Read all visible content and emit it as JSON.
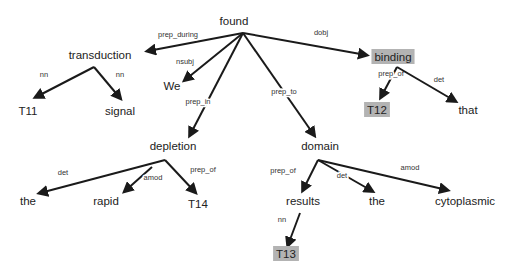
{
  "colors": {
    "background": "#ffffff",
    "edge": "#1a1a1a",
    "text": "#222222",
    "highlight": "#b3b3b3"
  },
  "nodes": [
    {
      "id": "found",
      "label": "found",
      "x": 234,
      "y": 21,
      "highlight": false
    },
    {
      "id": "transduction",
      "label": "transduction",
      "x": 100,
      "y": 55,
      "highlight": false
    },
    {
      "id": "We",
      "label": "We",
      "x": 172,
      "y": 86,
      "highlight": false
    },
    {
      "id": "binding",
      "label": "binding",
      "x": 393,
      "y": 57,
      "highlight": true
    },
    {
      "id": "T11",
      "label": "T11",
      "x": 28,
      "y": 111,
      "highlight": false
    },
    {
      "id": "signal",
      "label": "signal",
      "x": 120,
      "y": 111,
      "highlight": false
    },
    {
      "id": "T12",
      "label": "T12",
      "x": 377,
      "y": 110,
      "highlight": true
    },
    {
      "id": "that",
      "label": "that",
      "x": 468,
      "y": 110,
      "highlight": false
    },
    {
      "id": "depletion",
      "label": "depletion",
      "x": 173,
      "y": 146,
      "highlight": false
    },
    {
      "id": "domain",
      "label": "domain",
      "x": 320,
      "y": 146,
      "highlight": false
    },
    {
      "id": "the1",
      "label": "the",
      "x": 28,
      "y": 201,
      "highlight": false
    },
    {
      "id": "rapid",
      "label": "rapid",
      "x": 106,
      "y": 201,
      "highlight": false
    },
    {
      "id": "T14",
      "label": "T14",
      "x": 198,
      "y": 204,
      "highlight": false
    },
    {
      "id": "results",
      "label": "results",
      "x": 303,
      "y": 201,
      "highlight": false
    },
    {
      "id": "the2",
      "label": "the",
      "x": 377,
      "y": 201,
      "highlight": false
    },
    {
      "id": "cytoplasmic",
      "label": "cytoplasmic",
      "x": 465,
      "y": 201,
      "highlight": false
    },
    {
      "id": "T13",
      "label": "T13",
      "x": 286,
      "y": 254,
      "highlight": true
    }
  ],
  "edges": [
    {
      "from": "found",
      "to": "transduction",
      "label": "prep_during",
      "x1": 243,
      "y1": 33,
      "x2": 148,
      "y2": 51,
      "lx": 178,
      "ly": 37
    },
    {
      "from": "found",
      "to": "We",
      "label": "nsubj",
      "x1": 243,
      "y1": 33,
      "x2": 185,
      "y2": 80,
      "lx": 185,
      "ly": 64
    },
    {
      "from": "found",
      "to": "depletion",
      "label": "prep_in",
      "x1": 243,
      "y1": 33,
      "x2": 190,
      "y2": 135,
      "lx": 198,
      "ly": 104
    },
    {
      "from": "found",
      "to": "domain",
      "label": "prep_to",
      "x1": 243,
      "y1": 33,
      "x2": 314,
      "y2": 135,
      "lx": 284,
      "ly": 94
    },
    {
      "from": "found",
      "to": "binding",
      "label": "dobj",
      "x1": 243,
      "y1": 33,
      "x2": 366,
      "y2": 55,
      "lx": 321,
      "ly": 35
    },
    {
      "from": "transduction",
      "to": "T11",
      "label": "nn",
      "x1": 94,
      "y1": 67,
      "x2": 36,
      "y2": 97,
      "lx": 44,
      "ly": 77
    },
    {
      "from": "transduction",
      "to": "signal",
      "label": "nn",
      "x1": 94,
      "y1": 67,
      "x2": 120,
      "y2": 98,
      "lx": 120,
      "ly": 77
    },
    {
      "from": "binding",
      "to": "T12",
      "label": "prep_of",
      "x1": 397,
      "y1": 67,
      "x2": 381,
      "y2": 97,
      "lx": 111,
      "ly": 0,
      "label_x": 391,
      "label_y": 76
    },
    {
      "from": "binding",
      "to": "that",
      "label": "det",
      "x1": 397,
      "y1": 67,
      "x2": 455,
      "y2": 101,
      "lx": 439,
      "ly": 82
    },
    {
      "from": "depletion",
      "to": "the1",
      "label": "det",
      "x1": 165,
      "y1": 160,
      "x2": 40,
      "y2": 193,
      "lx": 63,
      "ly": 175
    },
    {
      "from": "depletion",
      "to": "rapid",
      "label": "amod",
      "x1": 152,
      "y1": 167,
      "x2": 125,
      "y2": 191,
      "lx": 153,
      "ly": 180
    },
    {
      "from": "depletion",
      "to": "T14",
      "label": "prep_of",
      "x1": 165,
      "y1": 160,
      "x2": 195,
      "y2": 192,
      "lx": 203,
      "ly": 172
    },
    {
      "from": "domain",
      "to": "results",
      "label": "prep_of",
      "x1": 318,
      "y1": 160,
      "x2": 303,
      "y2": 190,
      "lx": 283,
      "ly": 173
    },
    {
      "from": "domain",
      "to": "the2",
      "label": "det",
      "x1": 318,
      "y1": 160,
      "x2": 372,
      "y2": 191,
      "lx": 342,
      "ly": 178
    },
    {
      "from": "domain",
      "to": "cytoplasmic",
      "label": "amod",
      "x1": 318,
      "y1": 160,
      "x2": 447,
      "y2": 190,
      "lx": 410,
      "ly": 170
    },
    {
      "from": "results",
      "to": "T13",
      "label": "nn",
      "x1": 300,
      "y1": 213,
      "x2": 288,
      "y2": 245,
      "lx": 282,
      "ly": 222
    }
  ]
}
